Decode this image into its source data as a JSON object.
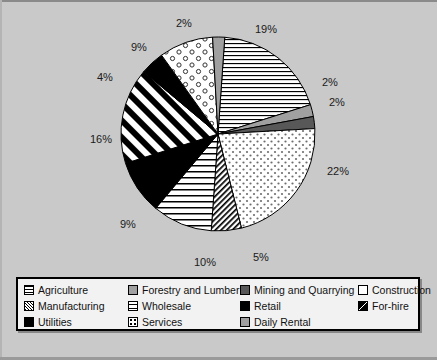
{
  "chart_data": {
    "type": "pie",
    "title": "",
    "xlabel": "",
    "ylabel": "",
    "legend_position": "bottom",
    "grid": false,
    "unit": "%",
    "categories": [
      "Agriculture",
      "Forestry and Lumber",
      "Mining and Quarrying",
      "Construction",
      "Manufacturing",
      "Wholesale",
      "Retail",
      "For-hire",
      "Utilities",
      "Services",
      "Daily Rental"
    ],
    "values": [
      19,
      2,
      2,
      22,
      5,
      10,
      9,
      16,
      4,
      9,
      2
    ],
    "labels": [
      "19%",
      "2%",
      "2%",
      "22%",
      "5%",
      "10%",
      "9%",
      "16%",
      "4%",
      "9%",
      "2%"
    ],
    "slices": [
      {
        "name": "Agriculture",
        "value": 19,
        "label": "19%",
        "pattern": "horizontal-lines",
        "fill": "#ffffff"
      },
      {
        "name": "Forestry and Lumber",
        "value": 2,
        "label": "2%",
        "pattern": "solid-gray",
        "fill": "#a0a0a0"
      },
      {
        "name": "Mining and Quarrying",
        "value": 2,
        "label": "2%",
        "pattern": "solid-dark-gray",
        "fill": "#585858"
      },
      {
        "name": "Construction",
        "value": 22,
        "label": "22%",
        "pattern": "fine-dots",
        "fill": "#ffffff"
      },
      {
        "name": "Manufacturing",
        "value": 5,
        "label": "5%",
        "pattern": "dense-diagonal",
        "fill": "#ffffff"
      },
      {
        "name": "Wholesale",
        "value": 10,
        "label": "10%",
        "pattern": "horizontal-lines-wide",
        "fill": "#ffffff"
      },
      {
        "name": "Retail",
        "value": 9,
        "label": "9%",
        "pattern": "solid-black",
        "fill": "#000000"
      },
      {
        "name": "For-hire",
        "value": 16,
        "label": "16%",
        "pattern": "bold-diagonal",
        "fill": "#ffffff"
      },
      {
        "name": "Utilities",
        "value": 4,
        "label": "4%",
        "pattern": "solid-black",
        "fill": "#000000"
      },
      {
        "name": "Services",
        "value": 9,
        "label": "9%",
        "pattern": "circles",
        "fill": "#ffffff"
      },
      {
        "name": "Daily Rental",
        "value": 2,
        "label": "2%",
        "pattern": "solid-gray",
        "fill": "#a0a0a0"
      }
    ]
  },
  "pie_labels": [
    {
      "text": "2%",
      "x": 176,
      "y": 14
    },
    {
      "text": "19%",
      "x": 255,
      "y": 20
    },
    {
      "text": "2%",
      "x": 322,
      "y": 73
    },
    {
      "text": "2%",
      "x": 329,
      "y": 93
    },
    {
      "text": "22%",
      "x": 327,
      "y": 162
    },
    {
      "text": "5%",
      "x": 253,
      "y": 248
    },
    {
      "text": "10%",
      "x": 194,
      "y": 253
    },
    {
      "text": "9%",
      "x": 120,
      "y": 215
    },
    {
      "text": "16%",
      "x": 90,
      "y": 130
    },
    {
      "text": "4%",
      "x": 97,
      "y": 68
    },
    {
      "text": "9%",
      "x": 131,
      "y": 38
    }
  ],
  "legend": {
    "items": [
      {
        "label": "Agriculture",
        "swatch": "hlines",
        "name": "agriculture"
      },
      {
        "label": "Forestry and Lumber",
        "swatch": "gray",
        "name": "forestry-and-lumber"
      },
      {
        "label": "Mining and Quarrying",
        "swatch": "darkgray",
        "name": "mining-and-quarrying"
      },
      {
        "label": "Construction",
        "swatch": "white",
        "name": "construction"
      },
      {
        "label": "Manufacturing",
        "swatch": "hatch-dense",
        "name": "manufacturing"
      },
      {
        "label": "Wholesale",
        "swatch": "hlines-wide",
        "name": "wholesale"
      },
      {
        "label": "Retail",
        "swatch": "black",
        "name": "retail"
      },
      {
        "label": "For-hire",
        "swatch": "diag-tri",
        "name": "for-hire"
      },
      {
        "label": "Utilities",
        "swatch": "black",
        "name": "utilities"
      },
      {
        "label": "Services",
        "swatch": "dots",
        "name": "services"
      },
      {
        "label": "Daily Rental",
        "swatch": "gray",
        "name": "daily-rental"
      }
    ]
  },
  "colors": {
    "background": "#c9c9c9",
    "legend_background": "#f2f2f2",
    "outline": "#000000",
    "gray": "#a0a0a0",
    "dark_gray": "#585858"
  },
  "pie_geometry": {
    "cx": 218,
    "cy": 131,
    "r": 97,
    "start_angle_deg": -86
  }
}
